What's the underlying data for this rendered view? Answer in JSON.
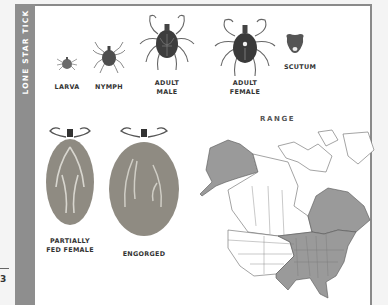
{
  "figure": {
    "side_title": "LONE STAR TICK",
    "edge_mark": "3",
    "stages": [
      {
        "label": "LARVA"
      },
      {
        "label": "NYMPH"
      },
      {
        "label_line1": "ADULT",
        "label_line2": "MALE"
      },
      {
        "label_line1": "ADULT",
        "label_line2": "FEMALE"
      },
      {
        "label": "SCUTUM"
      }
    ],
    "fed_stages": [
      {
        "label_line1": "PARTIALLY",
        "label_line2": "FED FEMALE"
      },
      {
        "label": "ENGORGED"
      }
    ],
    "range": {
      "title": "RANGE",
      "shaded_regions": [
        "Alaska",
        "Eastern Canada",
        "Eastern and Central United States"
      ],
      "shade_color": "#9a9a9a",
      "unshaded_color": "#ffffff"
    }
  },
  "colors": {
    "side_band": "#8e8e8e",
    "border": "#8a8a8a",
    "tick_body": "#5a5a5a",
    "engorged_body": "#8f8b82"
  }
}
